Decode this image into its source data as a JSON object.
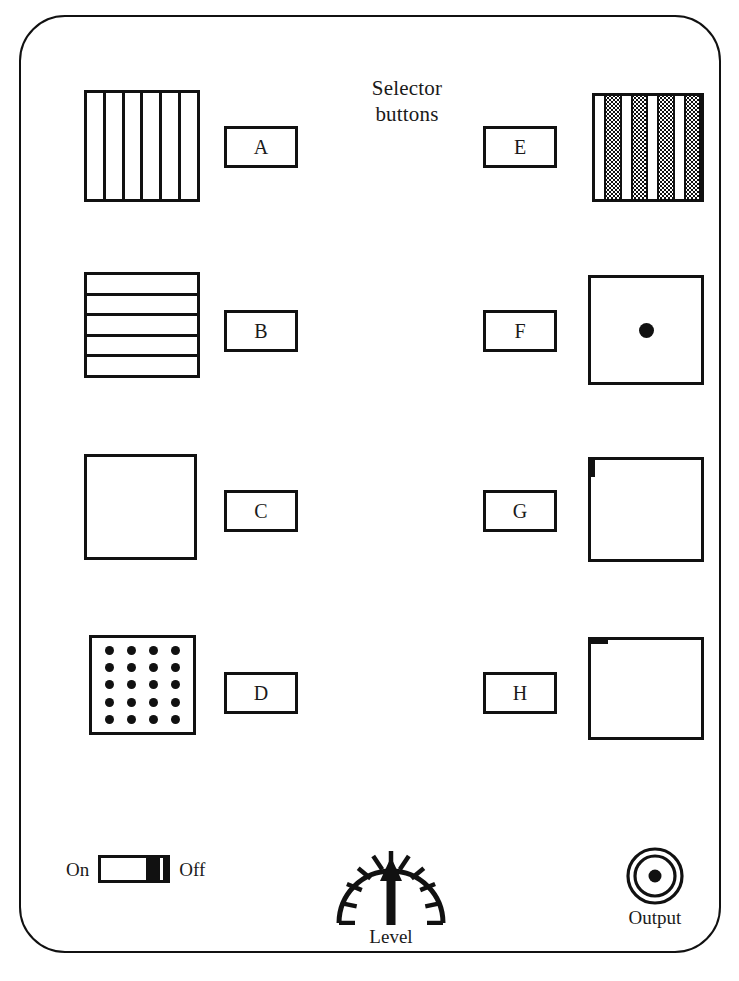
{
  "device": {
    "title_lines": [
      "Selector",
      "buttons"
    ],
    "frame_color": "#111111",
    "background_color": "#ffffff"
  },
  "selectors": [
    {
      "label": "A",
      "swatch": "vertical-bars",
      "swatch_bars": 6,
      "button": {
        "left": 203,
        "top": 109
      },
      "swatch_box": {
        "left": 63,
        "top": 73,
        "width": 116,
        "height": 112
      }
    },
    {
      "label": "B",
      "swatch": "horizontal-bars",
      "swatch_bars": 5,
      "button": {
        "left": 203,
        "top": 293
      },
      "swatch_box": {
        "left": 63,
        "top": 255,
        "width": 116,
        "height": 106
      }
    },
    {
      "label": "C",
      "swatch": "fine-grid",
      "swatch_bars": 9,
      "button": {
        "left": 203,
        "top": 473
      },
      "swatch_box": {
        "left": 63,
        "top": 437,
        "width": 113,
        "height": 106
      }
    },
    {
      "label": "D",
      "swatch": "dot-matrix",
      "swatch_dot_columns": 4,
      "swatch_dot_rows": 5,
      "button": {
        "left": 203,
        "top": 655
      },
      "swatch_box": {
        "left": 68,
        "top": 618,
        "width": 107,
        "height": 100
      }
    },
    {
      "label": "E",
      "swatch": "stippled-bands",
      "swatch_bars": 4,
      "button": {
        "left": 462,
        "top": 109
      },
      "swatch_box": {
        "left": 571,
        "top": 76,
        "width": 112,
        "height": 109
      }
    },
    {
      "label": "F",
      "swatch": "centre-dot",
      "button": {
        "left": 462,
        "top": 293
      },
      "swatch_box": {
        "left": 567,
        "top": 258,
        "width": 116,
        "height": 110
      }
    },
    {
      "label": "G",
      "swatch": "horizontal-band",
      "button": {
        "left": 462,
        "top": 473
      },
      "swatch_box": {
        "left": 567,
        "top": 440,
        "width": 116,
        "height": 105
      }
    },
    {
      "label": "H",
      "swatch": "vertical-band",
      "button": {
        "left": 462,
        "top": 655
      },
      "swatch_box": {
        "left": 567,
        "top": 620,
        "width": 116,
        "height": 103
      }
    }
  ],
  "power_toggle": {
    "on_label": "On",
    "off_label": "Off",
    "state": "Off"
  },
  "level_control": {
    "caption": "Level",
    "pointer_direction": "up",
    "tick_count": 9
  },
  "output_jack": {
    "caption": "Output",
    "type": "coaxial-connector"
  }
}
